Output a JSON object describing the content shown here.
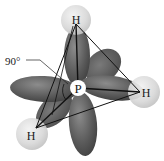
{
  "diagram": {
    "central_atom": {
      "label": "P",
      "x": 78,
      "y": 88
    },
    "hydrogens": [
      {
        "id": "top",
        "label": "H",
        "x": 76,
        "y": 19
      },
      {
        "id": "right",
        "label": "H",
        "x": 145,
        "y": 92
      },
      {
        "id": "bottom-left",
        "label": "H",
        "x": 32,
        "y": 134
      }
    ],
    "angle_label": "90°",
    "colors": {
      "lobe_dark": "#4a4a4a",
      "lobe_mid": "#6e6e6e",
      "lobe_light": "#8a8a8a",
      "h_sphere": "#d9d9d9",
      "h_sphere_edge": "#bdbdbd",
      "bond": "#111111"
    }
  }
}
